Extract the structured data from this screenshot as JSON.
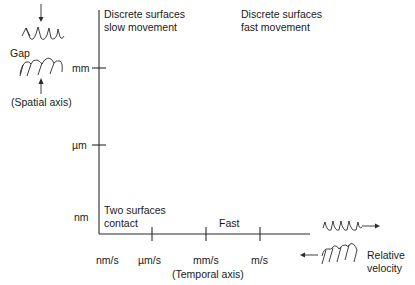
{
  "diagram": {
    "y_axis": {
      "label": "(Spatial axis)",
      "ticks": [
        "mm",
        "µm",
        "nm"
      ]
    },
    "x_axis": {
      "label": "(Temporal axis)",
      "ticks": [
        "nm/s",
        "µm/s",
        "mm/s",
        "m/s"
      ]
    },
    "regions": {
      "top_left_line1": "Discrete surfaces",
      "top_left_line2": "slow movement",
      "top_right_line1": "Discrete surfaces",
      "top_right_line2": "fast movement",
      "bottom_left_line1": "Two surfaces",
      "bottom_left_line2": "contact",
      "bottom_right": "Fast"
    },
    "insets": {
      "gap_label": "Gap",
      "relative_velocity_line1": "Relative",
      "relative_velocity_line2": "velocity"
    },
    "colors": {
      "line": "#2a2a2a",
      "text": "#1a1a1a",
      "background": "#ffffff"
    }
  }
}
